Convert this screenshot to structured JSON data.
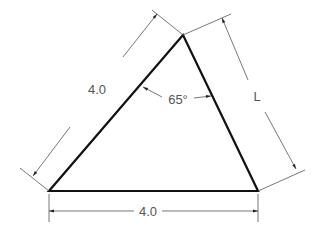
{
  "diagram": {
    "type": "triangle-dimension-drawing",
    "labels": {
      "left_side": "4.0",
      "bottom_side": "4.0",
      "right_side": "L",
      "apex_angle": "65°"
    },
    "colors": {
      "shape_stroke": "#111111",
      "dimension_stroke": "#555555",
      "text": "#555555",
      "background": "#ffffff"
    }
  }
}
